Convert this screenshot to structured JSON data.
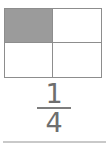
{
  "figure": {
    "title": "",
    "model": {
      "name": "fraction-area-model",
      "shape": "rectangle",
      "rows": 2,
      "columns": 2,
      "total_parts": 4,
      "shaded_parts": 1,
      "cells": [
        {
          "position": "top-left",
          "shaded": true,
          "label": ""
        },
        {
          "position": "top-right",
          "shaded": false,
          "label": ""
        },
        {
          "position": "bottom-left",
          "shaded": false,
          "label": ""
        },
        {
          "position": "bottom-right",
          "shaded": false,
          "label": ""
        }
      ]
    },
    "fraction": {
      "numerator": "1",
      "denominator": "4"
    },
    "colors": {
      "shaded_fill": "#9b9b9b",
      "unshaded_fill": "#ffffff",
      "grid_line": "#8d8d8d",
      "text": "#6e6e6e",
      "fraction_bar": "#7d7d7d",
      "rule": "#c9c9c9",
      "background": "#ffffff"
    }
  }
}
